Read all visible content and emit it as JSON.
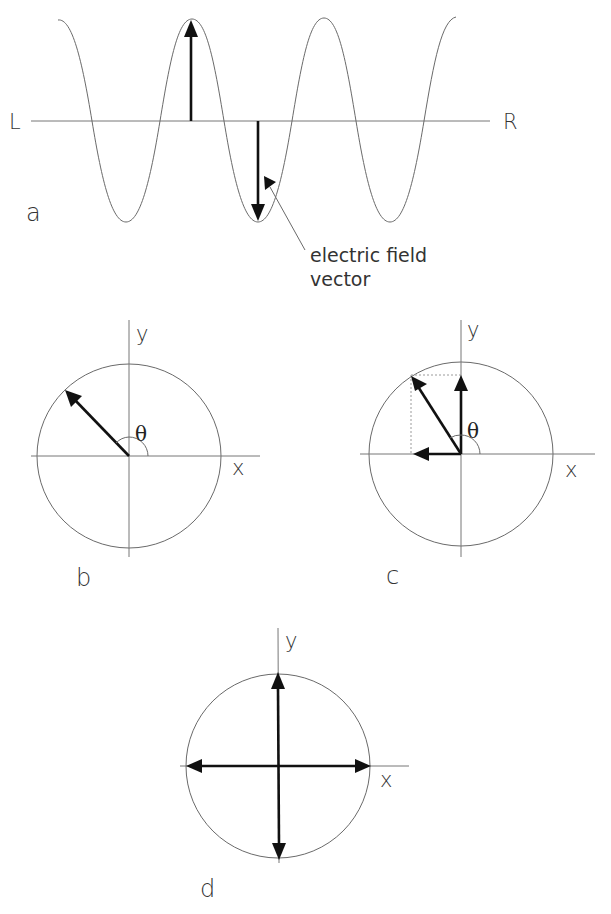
{
  "panels": {
    "a": {
      "label": "a",
      "left_label": "L",
      "right_label": "R",
      "annotation_line1": "electric field",
      "annotation_line2": "vector"
    },
    "b": {
      "label": "b",
      "y_label": "y",
      "x_label": "x",
      "angle_label": "θ"
    },
    "c": {
      "label": "c",
      "y_label": "y",
      "x_label": "x",
      "angle_label": "θ"
    },
    "d": {
      "label": "d",
      "y_label": "y",
      "x_label": "x"
    }
  },
  "colors": {
    "background": "#ffffff",
    "line": "#6a6a6a",
    "vector": "#111111",
    "text": "#333333"
  }
}
